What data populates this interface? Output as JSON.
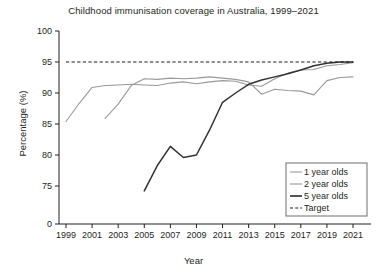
{
  "chart_data": {
    "type": "line",
    "title": "Childhood immunisation coverage in Australia, 1999–2021",
    "xlabel": "Year",
    "ylabel": "Percentage (%)",
    "xlim": [
      1999,
      2021
    ],
    "ylim": [
      75,
      100
    ],
    "y_axis_break": true,
    "y_zero_tick": "0",
    "grid": false,
    "legend_position": "bottom-right",
    "xticks": [
      1999,
      2001,
      2003,
      2005,
      2007,
      2009,
      2011,
      2013,
      2015,
      2017,
      2019,
      2021
    ],
    "xtick_labels": [
      "1999",
      "2001",
      "2003",
      "2005",
      "2007",
      "2009",
      "2011",
      "2013",
      "2015",
      "2017",
      "2019",
      "2021"
    ],
    "yticks": [
      75,
      80,
      85,
      90,
      95,
      100
    ],
    "ytick_labels": [
      "75",
      "80",
      "85",
      "90",
      "95",
      "100"
    ],
    "colors": {
      "one_year": "#9a9a9a",
      "two_year": "#9a9a9a",
      "five_year": "#333333",
      "target": "#1a1a1a",
      "axis": "#231f20"
    },
    "target_value": 95,
    "series": [
      {
        "name": "1 year olds",
        "style": "solid-light",
        "x": [
          1999,
          2000,
          2001,
          2002,
          2003,
          2004,
          2005,
          2006,
          2007,
          2008,
          2009,
          2010,
          2011,
          2012,
          2013,
          2014,
          2015,
          2016,
          2017,
          2018,
          2019,
          2020,
          2021
        ],
        "values": [
          85.4,
          88.3,
          90.9,
          91.2,
          91.3,
          91.4,
          91.3,
          91.2,
          91.6,
          91.8,
          91.5,
          91.8,
          92.0,
          91.9,
          91.3,
          91.1,
          92.3,
          93.2,
          93.7,
          93.8,
          94.4,
          94.6,
          94.9
        ]
      },
      {
        "name": "2 year olds",
        "style": "solid-light",
        "x": [
          2002,
          2003,
          2004,
          2005,
          2006,
          2007,
          2008,
          2009,
          2010,
          2011,
          2012,
          2013,
          2014,
          2015,
          2016,
          2017,
          2018,
          2019,
          2020,
          2021
        ],
        "values": [
          85.9,
          88.2,
          91.2,
          92.3,
          92.2,
          92.4,
          92.3,
          92.4,
          92.6,
          92.4,
          92.2,
          91.8,
          89.8,
          90.6,
          90.4,
          90.3,
          89.7,
          92.0,
          92.5,
          92.6
        ]
      },
      {
        "name": "5 year olds",
        "style": "solid-dark",
        "x": [
          2005,
          2006,
          2007,
          2008,
          2009,
          2010,
          2011,
          2012,
          2013,
          2014,
          2015,
          2016,
          2017,
          2018,
          2019,
          2020,
          2021
        ],
        "values": [
          74.2,
          78.3,
          81.4,
          79.6,
          80.0,
          84.0,
          88.5,
          90.0,
          91.4,
          92.1,
          92.6,
          93.1,
          93.7,
          94.4,
          94.8,
          95.0,
          95.0
        ]
      },
      {
        "name": "Target",
        "style": "dashed",
        "x": [
          1999,
          2021
        ],
        "values": [
          95,
          95
        ]
      }
    ]
  },
  "legend": {
    "items": [
      {
        "label": "1 year olds",
        "style": "solid-light"
      },
      {
        "label": "2 year olds",
        "style": "solid-light"
      },
      {
        "label": "5 year olds",
        "style": "solid-dark"
      },
      {
        "label": "Target",
        "style": "dashed"
      }
    ]
  }
}
